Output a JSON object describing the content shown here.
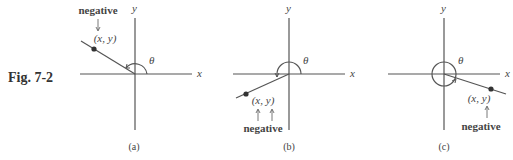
{
  "figure": {
    "label": "Fig. 7-2",
    "panels": [
      {
        "id": "a",
        "caption": "(a)",
        "point_label": "(x,  y)",
        "note": "negative",
        "theta": "θ",
        "x_axis": "x",
        "y_axis": "y"
      },
      {
        "id": "b",
        "caption": "(b)",
        "point_label": "(x,  y)",
        "note": "negative",
        "theta": "θ",
        "x_axis": "x",
        "y_axis": "y"
      },
      {
        "id": "c",
        "caption": "(c)",
        "point_label": "(x,  y)",
        "note": "negative",
        "theta": "θ",
        "x_axis": "x",
        "y_axis": "y"
      }
    ]
  },
  "colors": {
    "line": "#555555",
    "text": "#444444",
    "point": "#333333"
  }
}
